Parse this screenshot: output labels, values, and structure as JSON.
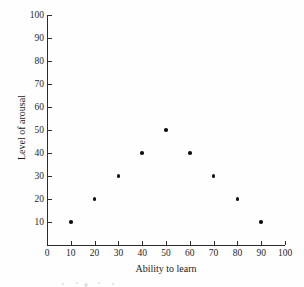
{
  "chart_data": {
    "type": "scatter",
    "title": "",
    "xlabel": "Ability to learn",
    "ylabel": "Level of arousal",
    "xlim": [
      0,
      100
    ],
    "ylim": [
      0,
      100
    ],
    "grid": false,
    "legend": null,
    "x_ticks": [
      0,
      10,
      20,
      30,
      40,
      50,
      60,
      70,
      80,
      90,
      100
    ],
    "y_ticks": [
      10,
      20,
      30,
      40,
      50,
      60,
      70,
      80,
      90,
      100
    ],
    "x_tick_labels": [
      "0",
      "10",
      "20",
      "30",
      "40",
      "50",
      "60",
      "70",
      "80",
      "90",
      "100"
    ],
    "y_tick_labels": [
      "10",
      "20",
      "30",
      "40",
      "50",
      "60",
      "70",
      "80",
      "90",
      "100"
    ],
    "series": [
      {
        "name": "arousal vs ability",
        "marker": "filled-circle",
        "color": "#111111",
        "points": [
          {
            "x": 10,
            "y": 10
          },
          {
            "x": 20,
            "y": 20
          },
          {
            "x": 30,
            "y": 30
          },
          {
            "x": 40,
            "y": 40
          },
          {
            "x": 50,
            "y": 50
          },
          {
            "x": 60,
            "y": 40
          },
          {
            "x": 70,
            "y": 30
          },
          {
            "x": 80,
            "y": 20
          },
          {
            "x": 90,
            "y": 10
          }
        ]
      }
    ]
  },
  "style": {
    "axis_color": "#2b2b2b",
    "text_color": "#1a1a1a",
    "background": "#fefefe",
    "marker_color": "#111111"
  }
}
